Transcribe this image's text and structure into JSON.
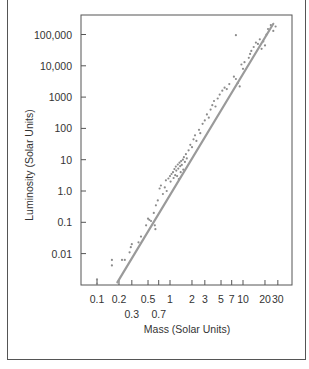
{
  "chart_data": {
    "type": "scatter",
    "title": "",
    "xlabel": "Mass (Solar Units)",
    "ylabel": "Luminosity (Solar Units)",
    "xscale": "log",
    "yscale": "log",
    "xlim": [
      0.06,
      40
    ],
    "ylim": [
      0.0012,
      300000
    ],
    "grid": false,
    "legend": null,
    "x_ticks": [
      {
        "value": 0.1,
        "label": "0.1",
        "row": 0
      },
      {
        "value": 0.2,
        "label": "0.2",
        "row": 0
      },
      {
        "value": 0.3,
        "label": "0.3",
        "row": 1
      },
      {
        "value": 0.5,
        "label": "0.5",
        "row": 0
      },
      {
        "value": 0.7,
        "label": "0.7",
        "row": 1
      },
      {
        "value": 1,
        "label": "1",
        "row": 0
      },
      {
        "value": 2,
        "label": "2",
        "row": 0
      },
      {
        "value": 3,
        "label": "3",
        "row": 0
      },
      {
        "value": 5,
        "label": "5",
        "row": 0
      },
      {
        "value": 7,
        "label": "7",
        "row": 0
      },
      {
        "value": 10,
        "label": "10",
        "row": 0
      },
      {
        "value": 20,
        "label": "20",
        "row": 0
      },
      {
        "value": 30,
        "label": "30",
        "row": 0
      }
    ],
    "y_ticks": [
      {
        "value": 100000,
        "label": "100,000"
      },
      {
        "value": 10000,
        "label": "10,000"
      },
      {
        "value": 1000,
        "label": "1000"
      },
      {
        "value": 100,
        "label": "100"
      },
      {
        "value": 10,
        "label": "10"
      },
      {
        "value": 1,
        "label": "1.0"
      },
      {
        "value": 0.1,
        "label": "0.1"
      },
      {
        "value": 0.01,
        "label": "0.01"
      }
    ],
    "fit_line": {
      "label": "mass-luminosity relation",
      "x": [
        0.19,
        26
      ],
      "y": [
        0.0012,
        220000
      ],
      "color": "#9a9a9a"
    },
    "series": [
      {
        "name": "main-sequence stars",
        "color": "#8c8c8c",
        "points": [
          [
            0.1,
            0.0015
          ],
          [
            0.1,
            0.0011
          ],
          [
            0.16,
            0.0063
          ],
          [
            0.16,
            0.0042
          ],
          [
            0.22,
            0.0063
          ],
          [
            0.24,
            0.0063
          ],
          [
            0.28,
            0.011
          ],
          [
            0.29,
            0.016
          ],
          [
            0.3,
            0.02
          ],
          [
            0.37,
            0.023
          ],
          [
            0.4,
            0.035
          ],
          [
            0.47,
            0.08
          ],
          [
            0.5,
            0.13
          ],
          [
            0.52,
            0.12
          ],
          [
            0.55,
            0.11
          ],
          [
            0.6,
            0.2
          ],
          [
            0.62,
            0.08
          ],
          [
            0.63,
            0.06
          ],
          [
            0.64,
            0.35
          ],
          [
            0.68,
            0.5
          ],
          [
            0.72,
            1.2
          ],
          [
            0.75,
            1.5
          ],
          [
            0.8,
            0.8
          ],
          [
            0.85,
            1.3
          ],
          [
            0.88,
            2.2
          ],
          [
            0.9,
            1.0
          ],
          [
            0.95,
            2.5
          ],
          [
            1.0,
            3.0
          ],
          [
            1.02,
            2.0
          ],
          [
            1.05,
            3.5
          ],
          [
            1.1,
            4.0
          ],
          [
            1.12,
            2.6
          ],
          [
            1.15,
            5.0
          ],
          [
            1.18,
            3.2
          ],
          [
            1.2,
            6.0
          ],
          [
            1.22,
            4.5
          ],
          [
            1.25,
            3.0
          ],
          [
            1.28,
            7.0
          ],
          [
            1.3,
            5.2
          ],
          [
            1.32,
            2.4
          ],
          [
            1.35,
            8.0
          ],
          [
            1.38,
            6.2
          ],
          [
            1.4,
            4.0
          ],
          [
            1.42,
            9.0
          ],
          [
            1.45,
            6.8
          ],
          [
            1.5,
            10
          ],
          [
            1.52,
            4.8
          ],
          [
            1.55,
            12
          ],
          [
            1.6,
            8.5
          ],
          [
            1.65,
            15
          ],
          [
            1.7,
            11
          ],
          [
            1.8,
            20
          ],
          [
            1.9,
            30
          ],
          [
            2.0,
            25
          ],
          [
            2.1,
            45
          ],
          [
            2.2,
            60
          ],
          [
            2.3,
            40
          ],
          [
            2.5,
            90
          ],
          [
            2.6,
            70
          ],
          [
            2.8,
            140
          ],
          [
            3.0,
            180
          ],
          [
            3.2,
            280
          ],
          [
            3.4,
            220
          ],
          [
            3.6,
            400
          ],
          [
            3.8,
            550
          ],
          [
            4.0,
            750
          ],
          [
            4.2,
            500
          ],
          [
            4.5,
            900
          ],
          [
            4.8,
            1200
          ],
          [
            5.2,
            1600
          ],
          [
            5.6,
            2000
          ],
          [
            6.0,
            1800
          ],
          [
            6.5,
            2600
          ],
          [
            7.5,
            4500
          ],
          [
            8.0,
            3800
          ],
          [
            8.5,
            2800
          ],
          [
            8.0,
            95000
          ],
          [
            9.0,
            2200
          ],
          [
            9.5,
            11000
          ],
          [
            10,
            8000
          ],
          [
            10.5,
            13000
          ],
          [
            12,
            18000
          ],
          [
            12.5,
            24000
          ],
          [
            13,
            30000
          ],
          [
            14,
            40000
          ],
          [
            15,
            55000
          ],
          [
            16,
            50000
          ],
          [
            17,
            70000
          ],
          [
            18,
            35000
          ],
          [
            19,
            60000
          ],
          [
            20,
            45000
          ],
          [
            21,
            100000
          ],
          [
            22,
            150000
          ],
          [
            24,
            200000
          ],
          [
            26,
            130000
          ],
          [
            28,
            180000
          ]
        ]
      }
    ]
  },
  "layout": {
    "plot_area": {
      "left": 81,
      "top": 15,
      "right": 292,
      "bottom": 285
    },
    "x_axis_px": {
      "origin_px": 170,
      "px_per_decade": 73
    },
    "y_axis_px": {
      "origin_px": 191,
      "px_per_decade": 31.3
    }
  }
}
